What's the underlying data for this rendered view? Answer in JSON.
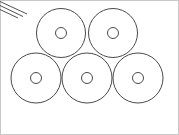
{
  "figure": {
    "canvas": {
      "width": 179,
      "height": 135
    },
    "background_color": "#ffffff",
    "stroke_color": "#4a4a4a",
    "hatch_color": "#3d3d3d",
    "frame_color": "#c9c9c9",
    "ring_count": 5,
    "rows": [
      {
        "name": "top-row",
        "ring_count": 2
      },
      {
        "name": "bottom-row",
        "ring_count": 3
      }
    ],
    "rings": [
      {
        "id": "ring-top-left",
        "row": "top-row",
        "cx": 61,
        "cy": 33,
        "outer_r": 24.5,
        "inner_r": 5.5,
        "label": "Top left ring"
      },
      {
        "id": "ring-top-right",
        "row": "top-row",
        "cx": 113,
        "cy": 33,
        "outer_r": 24.5,
        "inner_r": 5.5,
        "label": "Top right ring"
      },
      {
        "id": "ring-bottom-left",
        "row": "bottom-row",
        "cx": 36,
        "cy": 78,
        "outer_r": 25,
        "inner_r": 5.5,
        "label": "Bottom left ring"
      },
      {
        "id": "ring-bottom-center",
        "row": "bottom-row",
        "cx": 87,
        "cy": 78,
        "outer_r": 25,
        "inner_r": 5.5,
        "label": "Bottom center ring"
      },
      {
        "id": "ring-bottom-right",
        "row": "bottom-row",
        "cx": 138,
        "cy": 78,
        "outer_r": 25,
        "inner_r": 5.5,
        "label": "Bottom right ring"
      }
    ],
    "corner_hatch": {
      "id": "corner-hatch",
      "label": "Diagonal hatch lines at top-left corner",
      "line_count": 3,
      "lines": [
        {
          "x1": 0,
          "y1": 1.5,
          "x2": 27,
          "y2": 14
        },
        {
          "x1": 0,
          "y1": 5.5,
          "x2": 23,
          "y2": 16.5
        },
        {
          "x1": 0,
          "y1": 9.5,
          "x2": 18,
          "y2": 18
        }
      ]
    }
  }
}
